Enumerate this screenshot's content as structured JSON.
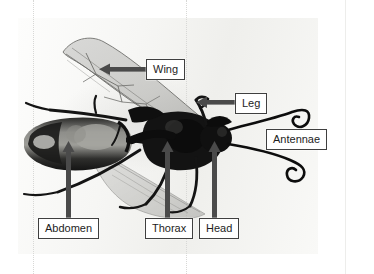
{
  "figure": {
    "kind": "labeled anatomical photograph",
    "background_color": "#ffffff",
    "photo_tone": "grayscale"
  },
  "labels": [
    {
      "id": "wing",
      "text": "Wing",
      "pointer": "arrow-left",
      "x": 146,
      "y": 59
    },
    {
      "id": "leg",
      "text": "Leg",
      "pointer": "arrow-left",
      "x": 235,
      "y": 93
    },
    {
      "id": "antennae",
      "text": "Antennae",
      "pointer": "none",
      "x": 266,
      "y": 129
    },
    {
      "id": "abdomen",
      "text": "Abdomen",
      "pointer": "arrow-up",
      "x": 38,
      "y": 218
    },
    {
      "id": "thorax",
      "text": "Thorax",
      "pointer": "arrow-up",
      "x": 145,
      "y": 218
    },
    {
      "id": "head",
      "text": "Head",
      "pointer": "arrow-up",
      "x": 199,
      "y": 218
    }
  ],
  "colors": {
    "label_border": "#3f3f3f",
    "label_fill": "#ffffff",
    "label_text": "#1d1d1d",
    "arrow": "#4a4a4a",
    "body_dark": "#141414",
    "body_mid": "#5a5a58",
    "wing_tint": "#b9b9b7",
    "guide_line": "#d8d8d6"
  }
}
